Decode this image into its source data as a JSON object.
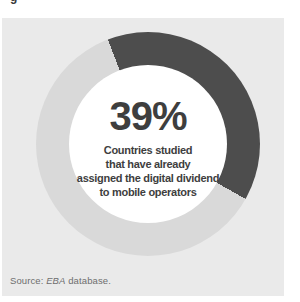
{
  "figure": {
    "label_fragment": "g"
  },
  "chart_data": {
    "type": "pie",
    "subtype": "donut",
    "title": "",
    "center_value": "39%",
    "center_caption_lines": [
      "Countries studied",
      "that have already",
      "assigned the digital dividend",
      "to mobile operators"
    ],
    "slices": [
      {
        "label": "Countries studied that have already assigned the digital dividend to mobile operators",
        "value": 39,
        "color": "#4d4d4d"
      },
      {
        "label": "Remaining countries studied",
        "value": 61,
        "color": "#d9d9d9"
      }
    ],
    "start_angle_deg": -21,
    "legend": "none",
    "grid": false
  },
  "source": {
    "prefix": "Source: ",
    "emphasis": "EBA",
    "suffix": " database."
  },
  "colors": {
    "page_bg": "#ffffff",
    "card_bg": "#eaeaea",
    "hole_bg": "#ffffff",
    "slice_dark": "#4d4d4d",
    "slice_light": "#d9d9d9",
    "text_dark": "#3e3e3e",
    "text_source": "#6e6e6e"
  }
}
